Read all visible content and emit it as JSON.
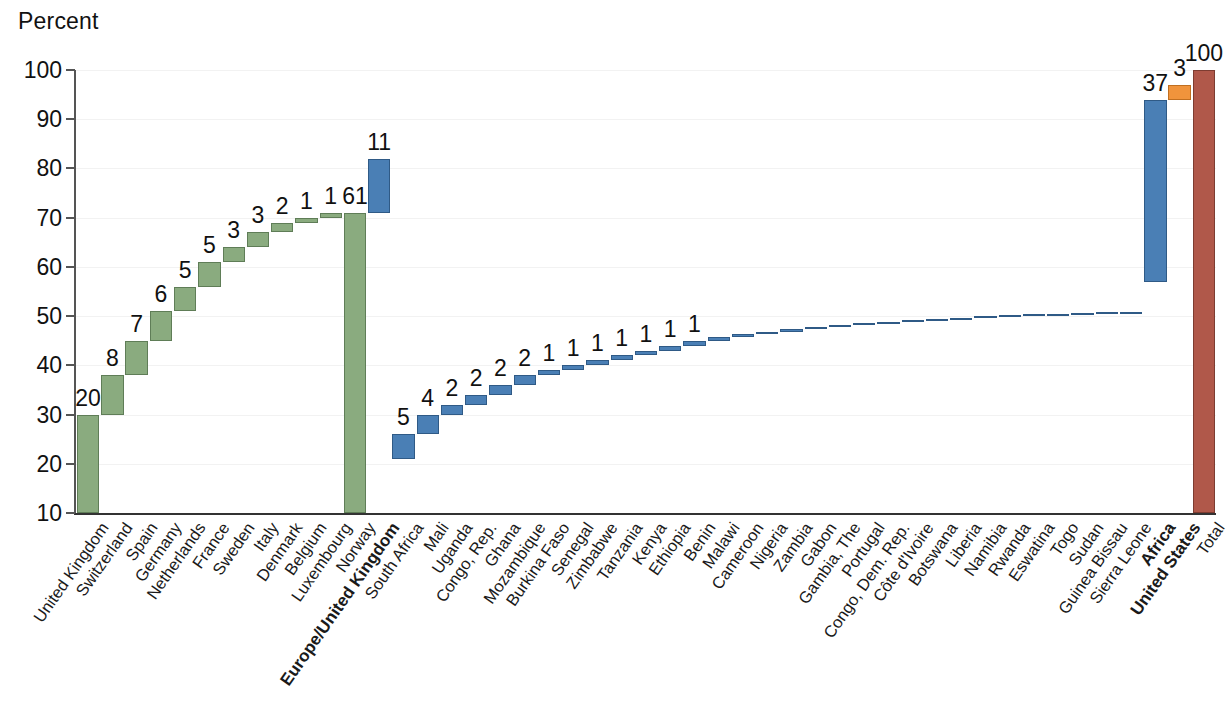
{
  "chart_data": {
    "type": "bar",
    "chart_style": "waterfall",
    "title": "",
    "ylabel": "Percent",
    "xlabel": "",
    "ylim": [
      10,
      100
    ],
    "yticks": [
      10,
      20,
      30,
      40,
      50,
      60,
      70,
      80,
      90,
      100
    ],
    "grid": true,
    "legend": null,
    "categories": [
      "United Kingdom",
      "Switzerland",
      "Spain",
      "Germany",
      "Netherlands",
      "France",
      "Sweden",
      "Italy",
      "Denmark",
      "Belgium",
      "Luxembourg",
      "Norway",
      "Europe/United Kingdom",
      "South Africa",
      "Mali",
      "Uganda",
      "Congo, Rep.",
      "Ghana",
      "Mozambique",
      "Burkina Faso",
      "Senegal",
      "Zimbabwe",
      "Tanzania",
      "Kenya",
      "Ethiopia",
      "Benin",
      "Malawi",
      "Cameroon",
      "Nigeria",
      "Zambia",
      "Gabon",
      "Gambia, The",
      "Portugal",
      "Congo, Dem. Rep.",
      "Côte d'Ivoire",
      "Botswana",
      "Liberia",
      "Namibia",
      "Rwanda",
      "Eswatina",
      "Togo",
      "Sudan",
      "Guinea Bissau",
      "Sierra Leone",
      "Africa",
      "United States",
      "Total"
    ],
    "values": [
      20,
      8,
      7,
      6,
      5,
      5,
      3,
      3,
      2,
      1,
      1,
      61,
      11,
      5,
      4,
      2,
      2,
      2,
      2,
      1,
      1,
      1,
      1,
      1,
      1,
      1,
      0.7,
      0.6,
      0.5,
      0.5,
      0.4,
      0.4,
      0.4,
      0.35,
      0.3,
      0.3,
      0.25,
      0.25,
      0.2,
      0.2,
      0.15,
      0.15,
      0.1,
      0.1,
      37,
      3,
      100
    ],
    "value_labels": [
      "20",
      "8",
      "7",
      "6",
      "5",
      "5",
      "3",
      "3",
      "2",
      "1",
      "1",
      "61",
      "11",
      "5",
      "4",
      "2",
      "2",
      "2",
      "2",
      "1",
      "1",
      "1",
      "1",
      "1",
      "1",
      "1",
      "",
      "",
      "",
      "",
      "",
      "",
      "",
      "",
      "",
      "",
      "",
      "",
      "",
      "",
      "",
      "",
      "",
      "",
      "37",
      "3",
      "100"
    ],
    "bar_kinds": [
      "step",
      "step",
      "step",
      "step",
      "step",
      "step",
      "step",
      "step",
      "step",
      "step",
      "step",
      "total",
      "step",
      "step",
      "step",
      "step",
      "step",
      "step",
      "step",
      "step",
      "step",
      "step",
      "step",
      "step",
      "step",
      "step",
      "step",
      "step",
      "step",
      "step",
      "step",
      "step",
      "step",
      "step",
      "step",
      "step",
      "step",
      "step",
      "step",
      "step",
      "step",
      "step",
      "step",
      "step",
      "total",
      "step",
      "total"
    ],
    "colors": [
      "green",
      "green",
      "green",
      "green",
      "green",
      "green",
      "green",
      "green",
      "green",
      "green",
      "green",
      "green",
      "blue",
      "blue",
      "blue",
      "blue",
      "blue",
      "blue",
      "blue",
      "blue",
      "blue",
      "blue",
      "blue",
      "blue",
      "blue",
      "blue",
      "blue",
      "blue",
      "blue",
      "blue",
      "blue",
      "blue",
      "blue",
      "blue",
      "blue",
      "blue",
      "blue",
      "blue",
      "blue",
      "blue",
      "blue",
      "blue",
      "blue",
      "blue",
      "blue",
      "orange",
      "darkred"
    ],
    "bold_categories": [
      "Europe/United Kingdom",
      "Africa",
      "United States"
    ],
    "palette": {
      "green": "#8aab7f",
      "blue": "#4a7fb5",
      "orange": "#f0943c",
      "darkred": "#b0584a",
      "axis": "#333333",
      "grid": "#f2f2f2",
      "text": "#111111"
    }
  }
}
